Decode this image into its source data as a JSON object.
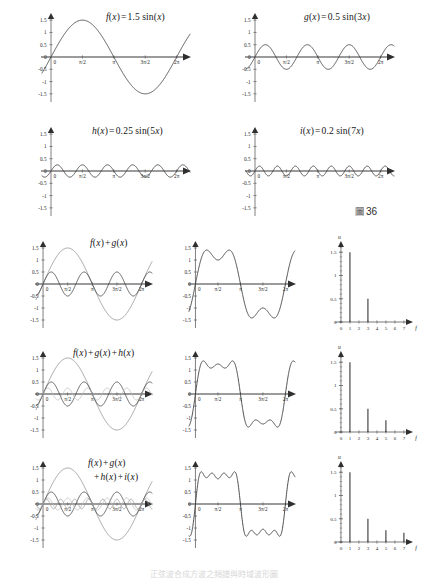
{
  "figure": {
    "label_prefix": "圖",
    "label_number": "36",
    "bottom_caption": "正弦波合成方波之頻譜與時域波形圖"
  },
  "axes": {
    "y_ticks": [
      "1.5",
      "1",
      "0.5",
      "0",
      "-0.5",
      "-1",
      "-1.5"
    ],
    "y_values": [
      1.5,
      1,
      0.5,
      0,
      -0.5,
      -1,
      -1.5
    ],
    "x_ticks": [
      "0",
      "π/2",
      "π",
      "3π/2",
      "2π"
    ],
    "x_values": [
      0,
      1.5707963,
      3.1415927,
      4.712389,
      6.2831853
    ],
    "spectrum_x_ticks": [
      "0",
      "1",
      "2",
      "3",
      "4",
      "5",
      "6",
      "7"
    ],
    "spectrum_x_axis_name": "f",
    "spectrum_y_axis_name": "u",
    "spectrum_y_ticks": [
      "1.5",
      "1",
      "0.5",
      "0"
    ],
    "spectrum_y_values": [
      1.5,
      1,
      0.5,
      0
    ]
  },
  "colors": {
    "curve_dark": "#3a3a3a",
    "curve_mid": "#6f6f6f",
    "curve_light": "#a8a8a8",
    "curve_lighter": "#c4c4c4",
    "axis": "#5f5f5f",
    "axis_x_thick": "#7a7a7a",
    "text": "#1c1c1c",
    "spike": "#2d2d2d"
  },
  "chart_data": [
    {
      "id": "f-component",
      "type": "line",
      "title": "f(x) = 1.5 sin(x)",
      "title_parts": {
        "fn": "f",
        "arg": "(x)",
        "eq": " = ",
        "amp": "1.5",
        "wave": " sin(",
        "inner": "x",
        "close": ")"
      },
      "amplitude": 1.5,
      "harmonic": 1,
      "xlabel": "x",
      "ylabel": "",
      "xlim": [
        -0.45,
        6.95
      ],
      "ylim": [
        -1.75,
        1.75
      ],
      "grid": false,
      "series": [
        {
          "name": "f(x)",
          "expression": "1.5*sin(1*x)",
          "amplitude": 1.5,
          "harmonic": 1,
          "color": "#3a3a3a"
        }
      ]
    },
    {
      "id": "g-component",
      "type": "line",
      "title": "g(x) = 0.5 sin(3x)",
      "title_parts": {
        "fn": "g",
        "arg": "(x)",
        "eq": " = ",
        "amp": "0.5",
        "wave": " sin(",
        "inner": "3x",
        "close": ")"
      },
      "amplitude": 0.5,
      "harmonic": 3,
      "xlabel": "x",
      "ylabel": "",
      "xlim": [
        -0.45,
        6.95
      ],
      "ylim": [
        -1.75,
        1.75
      ],
      "grid": false,
      "series": [
        {
          "name": "g(x)",
          "expression": "0.5*sin(3*x)",
          "amplitude": 0.5,
          "harmonic": 3,
          "color": "#3a3a3a"
        }
      ]
    },
    {
      "id": "h-component",
      "type": "line",
      "title": "h(x) = 0.25 sin(5x)",
      "title_parts": {
        "fn": "h",
        "arg": "(x)",
        "eq": " = ",
        "amp": "0.25",
        "wave": " sin(",
        "inner": "5x",
        "close": ")"
      },
      "amplitude": 0.25,
      "harmonic": 5,
      "xlabel": "x",
      "ylabel": "",
      "xlim": [
        -0.45,
        6.95
      ],
      "ylim": [
        -1.75,
        1.75
      ],
      "grid": false,
      "series": [
        {
          "name": "h(x)",
          "expression": "0.25*sin(5*x)",
          "amplitude": 0.25,
          "harmonic": 5,
          "color": "#3a3a3a"
        }
      ]
    },
    {
      "id": "i-component",
      "type": "line",
      "title": "i(x) = 0.2 sin(7x)",
      "title_parts": {
        "fn": "i",
        "arg": "(x)",
        "eq": " = ",
        "amp": "0.2",
        "wave": " sin(",
        "inner": "7x",
        "close": ")"
      },
      "amplitude": 0.2,
      "harmonic": 7,
      "xlabel": "x",
      "ylabel": "",
      "xlim": [
        -0.45,
        6.95
      ],
      "ylim": [
        -1.75,
        1.75
      ],
      "grid": false,
      "series": [
        {
          "name": "i(x)",
          "expression": "0.2*sin(7*x)",
          "amplitude": 0.2,
          "harmonic": 7,
          "color": "#3a3a3a"
        }
      ]
    },
    {
      "id": "overlay-row1",
      "type": "line",
      "title": "f(x) + g(x)",
      "title_line1": "f(x) + g(x)",
      "title_line2": "",
      "xlim": [
        -0.45,
        6.95
      ],
      "ylim": [
        -1.75,
        1.75
      ],
      "grid": false,
      "series": [
        {
          "name": "f(x)",
          "amplitude": 1.5,
          "harmonic": 1,
          "color": "#8a8a8a"
        },
        {
          "name": "g(x)",
          "amplitude": 0.5,
          "harmonic": 3,
          "color": "#3a3a3a"
        }
      ]
    },
    {
      "id": "sum-row1",
      "type": "line",
      "title": "",
      "xlim": [
        -0.45,
        6.95
      ],
      "ylim": [
        -1.75,
        1.75
      ],
      "grid": false,
      "series": [
        {
          "name": "f+g",
          "harmonics": [
            1,
            3
          ],
          "amplitudes": [
            1.5,
            0.5
          ],
          "color": "#3a3a3a"
        }
      ]
    },
    {
      "id": "spectrum-row1",
      "type": "bar",
      "title": "",
      "xlabel": "f",
      "ylabel": "u",
      "categories": [
        "1",
        "3"
      ],
      "values": [
        1.5,
        0.5
      ],
      "xlim": [
        0,
        7.8
      ],
      "ylim": [
        0,
        1.72
      ],
      "grid": false
    },
    {
      "id": "overlay-row2",
      "type": "line",
      "title": "f(x) + g(x) + h(x)",
      "title_line1": "f(x) + g(x) + h(x)",
      "title_line2": "",
      "xlim": [
        -0.45,
        6.95
      ],
      "ylim": [
        -1.75,
        1.75
      ],
      "grid": false,
      "series": [
        {
          "name": "f(x)",
          "amplitude": 1.5,
          "harmonic": 1,
          "color": "#8a8a8a"
        },
        {
          "name": "g(x)",
          "amplitude": 0.5,
          "harmonic": 3,
          "color": "#3a3a3a"
        },
        {
          "name": "h(x)",
          "amplitude": 0.25,
          "harmonic": 5,
          "color": "#bdbdbd"
        }
      ]
    },
    {
      "id": "sum-row2",
      "type": "line",
      "title": "",
      "xlim": [
        -0.45,
        6.95
      ],
      "ylim": [
        -1.75,
        1.75
      ],
      "grid": false,
      "series": [
        {
          "name": "f+g+h",
          "harmonics": [
            1,
            3,
            5
          ],
          "amplitudes": [
            1.5,
            0.5,
            0.25
          ],
          "color": "#3a3a3a"
        }
      ]
    },
    {
      "id": "spectrum-row2",
      "type": "bar",
      "title": "",
      "xlabel": "f",
      "ylabel": "u",
      "categories": [
        "1",
        "3",
        "5"
      ],
      "values": [
        1.5,
        0.5,
        0.25
      ],
      "xlim": [
        0,
        7.8
      ],
      "ylim": [
        0,
        1.72
      ],
      "grid": false
    },
    {
      "id": "overlay-row3",
      "type": "line",
      "title": "f(x) + g(x) + h(x) + i(x)",
      "title_line1": "f(x) + g(x)",
      "title_line2": "+ h(x) + i(x)",
      "xlim": [
        -0.45,
        6.95
      ],
      "ylim": [
        -1.75,
        1.75
      ],
      "grid": false,
      "series": [
        {
          "name": "f(x)",
          "amplitude": 1.5,
          "harmonic": 1,
          "color": "#8a8a8a"
        },
        {
          "name": "g(x)",
          "amplitude": 0.5,
          "harmonic": 3,
          "color": "#3a3a3a"
        },
        {
          "name": "h(x)",
          "amplitude": 0.25,
          "harmonic": 5,
          "color": "#bdbdbd"
        },
        {
          "name": "i(x)",
          "amplitude": 0.2,
          "harmonic": 7,
          "color": "#9a9a9a"
        }
      ]
    },
    {
      "id": "sum-row3",
      "type": "line",
      "title": "",
      "xlim": [
        -0.45,
        6.95
      ],
      "ylim": [
        -1.75,
        1.75
      ],
      "grid": false,
      "series": [
        {
          "name": "f+g+h+i",
          "harmonics": [
            1,
            3,
            5,
            7
          ],
          "amplitudes": [
            1.5,
            0.5,
            0.25,
            0.2
          ],
          "color": "#3a3a3a"
        }
      ]
    },
    {
      "id": "spectrum-row3",
      "type": "bar",
      "title": "",
      "xlabel": "f",
      "ylabel": "u",
      "categories": [
        "1",
        "3",
        "5",
        "7"
      ],
      "values": [
        1.5,
        0.5,
        0.25,
        0.2
      ],
      "xlim": [
        0,
        7.8
      ],
      "ylim": [
        0,
        1.72
      ],
      "grid": false
    }
  ]
}
